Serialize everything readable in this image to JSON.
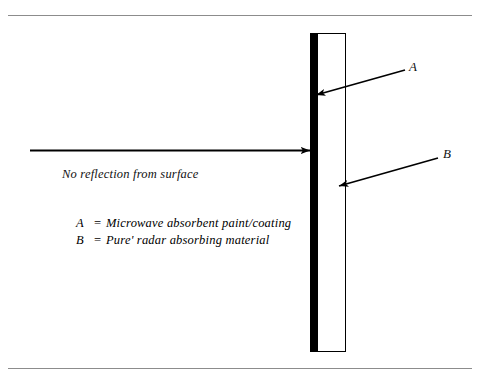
{
  "figure": {
    "width": 479,
    "height": 382,
    "background": "#ffffff",
    "rule_color": "#8c8c8c",
    "ink_color": "#000000"
  },
  "slab": {
    "layer_a_name": "microwave-absorbent-paint-coating",
    "layer_a_fill": "#000000",
    "layer_b_name": "pure-radar-absorbing-material",
    "layer_b_fill": "#ffffff",
    "layer_b_stroke": "#000000"
  },
  "callouts": {
    "a_letter": "A",
    "b_letter": "B"
  },
  "captions": {
    "no_reflection": "No reflection from surface"
  },
  "legend": [
    {
      "key": "A",
      "equals": "=",
      "description": "Microwave absorbent paint/coating"
    },
    {
      "key": "B",
      "equals": "=",
      "description": "Pure' radar absorbing material"
    }
  ]
}
